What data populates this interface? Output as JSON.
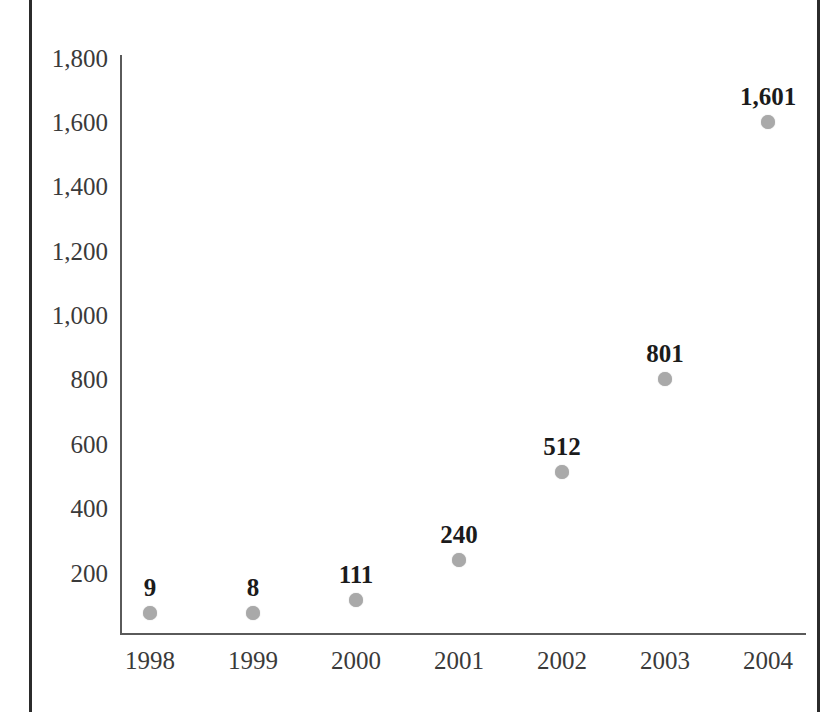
{
  "page": {
    "background_color": "#ffffff",
    "margin_rule_color": "#2b2b2b"
  },
  "chart_data": {
    "type": "scatter",
    "title": "",
    "subtitle": "",
    "xlabel": "",
    "ylabel": "",
    "categories": [
      "1998",
      "1999",
      "2000",
      "2001",
      "2002",
      "2003",
      "2004"
    ],
    "values": [
      9,
      8,
      111,
      240,
      512,
      801,
      1601
    ],
    "point_labels": [
      "9",
      "8",
      "111",
      "240",
      "512",
      "801",
      "1,601"
    ],
    "ylim": [
      0,
      1800
    ],
    "ytick_values": [
      1800,
      1600,
      1400,
      1200,
      1000,
      800,
      600,
      400,
      200
    ],
    "ytick_labels": [
      "1,800",
      "1,600",
      "1,400",
      "1,200",
      "1,000",
      "800",
      "600",
      "400",
      "200"
    ],
    "grid": false,
    "legend": "none",
    "marker_color": "#a9a9a9",
    "axis_color": "#5a5a5a",
    "label_color": "#3a3a3a",
    "data_label_color": "#1b1b1b",
    "series": [
      {
        "name": "",
        "values": [
          9,
          8,
          111,
          240,
          512,
          801,
          1601
        ]
      }
    ],
    "points": [
      {
        "x": "1998",
        "y": 9,
        "label": "9",
        "px": 150,
        "py": 613
      },
      {
        "x": "1999",
        "y": 8,
        "label": "8",
        "px": 253,
        "py": 613
      },
      {
        "x": "2000",
        "y": 111,
        "label": "111",
        "px": 356,
        "py": 600
      },
      {
        "x": "2001",
        "y": 240,
        "label": "240",
        "px": 459,
        "py": 560
      },
      {
        "x": "2002",
        "y": 512,
        "label": "512",
        "px": 562,
        "py": 472
      },
      {
        "x": "2003",
        "y": 801,
        "label": "801",
        "px": 665,
        "py": 379
      },
      {
        "x": "2004",
        "y": 1601,
        "label": "1,601",
        "px": 768,
        "py": 122
      }
    ],
    "ytick_positions": [
      {
        "label": "1,800",
        "py": 58
      },
      {
        "label": "1,600",
        "py": 122
      },
      {
        "label": "1,400",
        "py": 186
      },
      {
        "label": "1,200",
        "py": 251
      },
      {
        "label": "1,000",
        "py": 315
      },
      {
        "label": "800",
        "py": 379
      },
      {
        "label": "600",
        "py": 444
      },
      {
        "label": "400",
        "py": 508
      },
      {
        "label": "200",
        "py": 573
      }
    ]
  }
}
